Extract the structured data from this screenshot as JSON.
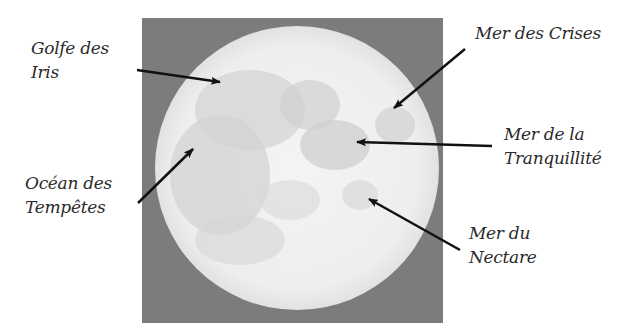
{
  "image": {
    "subject": "moon-full",
    "background_color": "#7c7c7c",
    "moon_color": "#f2f2f2",
    "maria_color": "#d2d2d2"
  },
  "labels": [
    {
      "id": "golfe-des-iris",
      "line1": "Golfe des",
      "line2": "Iris"
    },
    {
      "id": "mer-des-crises",
      "line1": "Mer des Crises",
      "line2": ""
    },
    {
      "id": "ocean-des-tempetes",
      "line1": "Océan des",
      "line2": "Tempêtes"
    },
    {
      "id": "mer-de-la-tranquillite",
      "line1": "Mer de la",
      "line2": "Tranquillité"
    },
    {
      "id": "mer-du-nectare",
      "line1": "Mer du",
      "line2": "Nectare"
    }
  ]
}
